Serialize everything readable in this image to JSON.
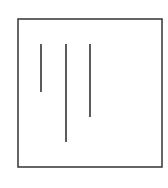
{
  "diagram": {
    "background": "#ffffff",
    "stroke_color": "#333333",
    "frame": {
      "x": 18,
      "y": 19,
      "width": 144,
      "height": 148,
      "stroke_width": 1.5
    },
    "lines": [
      {
        "x": 41,
        "y1": 44,
        "y2": 92
      },
      {
        "x": 66,
        "y1": 44,
        "y2": 142
      },
      {
        "x": 90,
        "y1": 44,
        "y2": 117
      }
    ]
  }
}
